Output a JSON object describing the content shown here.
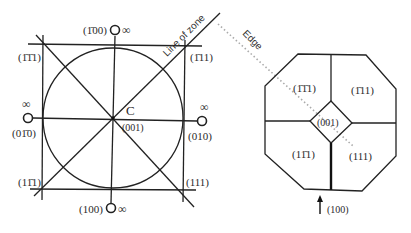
{
  "stereogram": {
    "center_label": "C",
    "center_pole": "(001)",
    "line_of_zone_label": "Line of zone",
    "poles": {
      "top": "(1̄00)",
      "bottom": "(100)",
      "left": "(01̄0)",
      "right": "(010)",
      "top_left": "(1̄1̄1)",
      "top_right": "(1̄11)",
      "bottom_left": "(11̄1)",
      "bottom_right": "(111)"
    },
    "infinity_symbol": "∞"
  },
  "edge_label": "Edge",
  "crystal": {
    "faces": {
      "top_left": "(1̄1̄1)",
      "top_right": "(1̄11)",
      "center": "(001)",
      "bottom_left": "(11̄1)",
      "bottom_right": "(111)"
    },
    "arrow_label": "(100)"
  }
}
